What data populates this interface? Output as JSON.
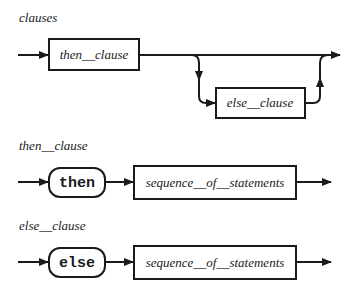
{
  "diagram": {
    "type": "syntax-railroad-diagram",
    "rules": [
      {
        "name": "clauses",
        "elements": [
          {
            "kind": "nonterminal",
            "label": "then__clause"
          },
          {
            "kind": "optional-nonterminal",
            "label": "else__clause"
          }
        ]
      },
      {
        "name": "then__clause",
        "elements": [
          {
            "kind": "terminal",
            "label": "then"
          },
          {
            "kind": "nonterminal",
            "label": "sequence__of__statements"
          }
        ]
      },
      {
        "name": "else__clause",
        "elements": [
          {
            "kind": "terminal",
            "label": "else"
          },
          {
            "kind": "nonterminal",
            "label": "sequence__of__statements"
          }
        ]
      }
    ]
  },
  "labels": {
    "rule1_title": "clauses",
    "rule1_box1": "then__clause",
    "rule1_box2": "else__clause",
    "rule2_title": "then__clause",
    "rule2_terminal": "then",
    "rule2_box": "sequence__of__statements",
    "rule3_title": "else__clause",
    "rule3_terminal": "else",
    "rule3_box": "sequence__of__statements"
  }
}
